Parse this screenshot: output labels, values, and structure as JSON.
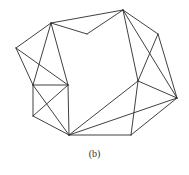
{
  "caption": "(b)",
  "colors": {
    "stroke": "#2a2a2a",
    "background": "#ffffff"
  },
  "vertices": {
    "A": [
      51,
      23
    ],
    "T": [
      123,
      10
    ],
    "D": [
      87,
      34
    ],
    "L": [
      16,
      48
    ],
    "BTL": [
      33,
      85
    ],
    "BTR": [
      68,
      85
    ],
    "BBL": [
      33,
      116
    ],
    "B": [
      69,
      135
    ],
    "RU": [
      158,
      34
    ],
    "MR": [
      138,
      81
    ],
    "FR": [
      177,
      98
    ],
    "BR": [
      131,
      135
    ]
  },
  "edges": [
    [
      "A",
      "T"
    ],
    [
      "A",
      "D"
    ],
    [
      "D",
      "T"
    ],
    [
      "A",
      "L"
    ],
    [
      "A",
      "BTL"
    ],
    [
      "A",
      "BTR"
    ],
    [
      "L",
      "BTL"
    ],
    [
      "L",
      "BTR"
    ],
    [
      "BTL",
      "BTR"
    ],
    [
      "BTL",
      "BBL"
    ],
    [
      "BTR",
      "B"
    ],
    [
      "BBL",
      "B"
    ],
    [
      "BTL",
      "B"
    ],
    [
      "BTR",
      "BBL"
    ],
    [
      "T",
      "MR"
    ],
    [
      "T",
      "FR"
    ],
    [
      "T",
      "RU"
    ],
    [
      "RU",
      "FR"
    ],
    [
      "RU",
      "MR"
    ],
    [
      "MR",
      "B"
    ],
    [
      "MR",
      "FR"
    ],
    [
      "MR",
      "BR"
    ],
    [
      "FR",
      "B"
    ],
    [
      "FR",
      "BR"
    ],
    [
      "B",
      "BR"
    ]
  ]
}
